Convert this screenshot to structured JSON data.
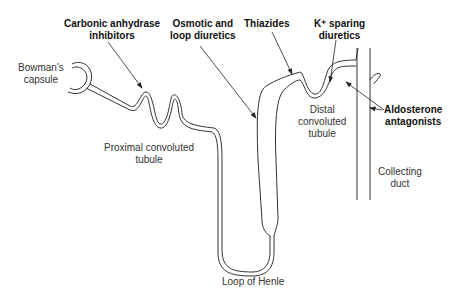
{
  "diagram": {
    "type": "nephron-diuretic-sites",
    "colors": {
      "line": "#333333",
      "background": "#ffffff",
      "text": "#222222"
    },
    "structures": {
      "bowmans_capsule": [
        "Bowman's",
        "capsule"
      ],
      "proximal_tubule": [
        "Proximal convoluted",
        "tubule"
      ],
      "loop_of_henle": [
        "Loop of Henle"
      ],
      "distal_tubule": [
        "Distal",
        "convoluted",
        "tubule"
      ],
      "collecting_duct": [
        "Collecting",
        "duct"
      ]
    },
    "drug_classes": {
      "carbonic_anhydrase": [
        "Carbonic anhydrase",
        "inhibitors"
      ],
      "osmotic_loop": [
        "Osmotic and",
        "loop diuretics"
      ],
      "thiazides": [
        "Thiazides"
      ],
      "k_sparing": [
        "K⁺ sparing",
        "diuretics"
      ],
      "aldosterone": [
        "Aldosterone",
        "antagonists"
      ]
    }
  }
}
